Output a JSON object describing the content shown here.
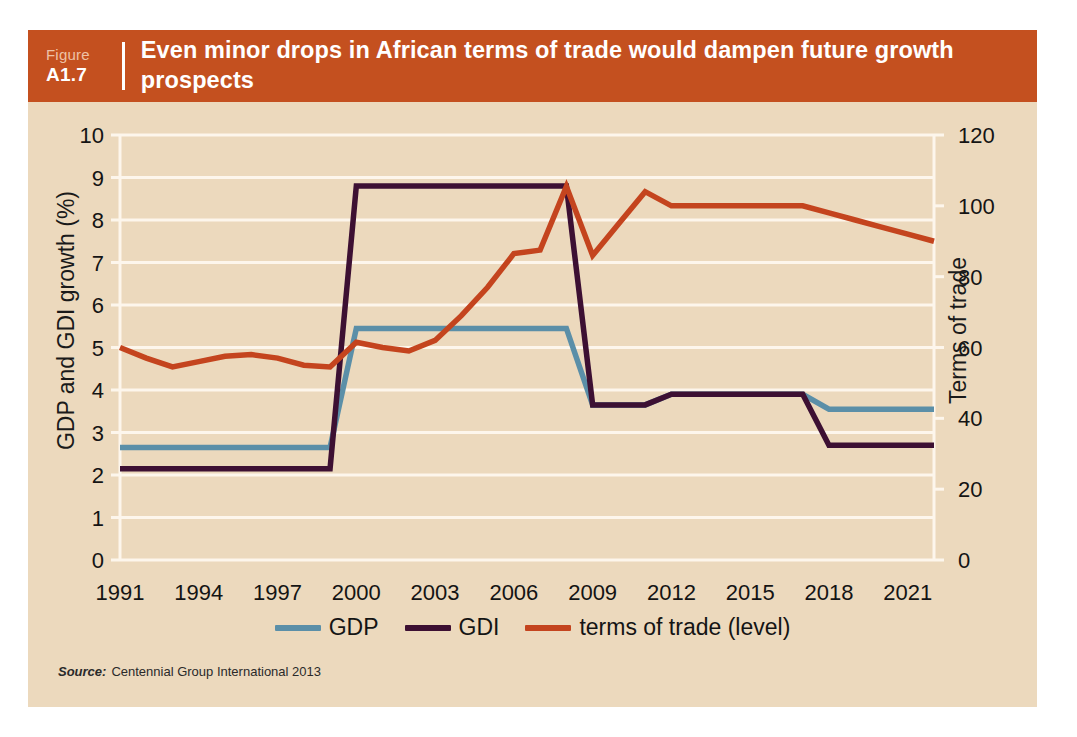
{
  "figure": {
    "label_word": "Figure",
    "number": "A1.7",
    "title": "Even minor drops in African terms of trade would dampen future growth prospects",
    "source_word": "Source:",
    "source_text": "Centennial Group International 2013"
  },
  "colors": {
    "header_bg": "#c4501f",
    "card_bg": "#ecd9bd",
    "gdp": "#5b8fa8",
    "gdi": "#3d1033",
    "terms_of_trade": "#c4441e",
    "gridline": "#fdf6ec",
    "text": "#141414"
  },
  "legend": {
    "position": "bottom-center",
    "items": [
      {
        "label": "GDP",
        "color": "#5b8fa8"
      },
      {
        "label": "GDI",
        "color": "#3d1033"
      },
      {
        "label": "terms of trade (level)",
        "color": "#c4441e"
      }
    ]
  },
  "chart_data": {
    "type": "line",
    "title": "Even minor drops in African terms of trade would dampen future growth prospects",
    "xlabel": "",
    "ylabel": "GDP and GDI growth (%)",
    "y2label": "Terms of trade",
    "grid": true,
    "xlim": [
      1991,
      2022
    ],
    "ylim": [
      0,
      10
    ],
    "y2lim": [
      0,
      120
    ],
    "yticks": [
      0,
      1,
      2,
      3,
      4,
      5,
      6,
      7,
      8,
      9,
      10
    ],
    "y2ticks": [
      0,
      20,
      40,
      60,
      80,
      100,
      120
    ],
    "xticks": [
      1991,
      1994,
      1997,
      2000,
      2003,
      2006,
      2009,
      2012,
      2015,
      2018,
      2021
    ],
    "x": [
      1991,
      1992,
      1993,
      1994,
      1995,
      1996,
      1997,
      1998,
      1999,
      2000,
      2001,
      2002,
      2003,
      2004,
      2005,
      2006,
      2007,
      2008,
      2009,
      2010,
      2011,
      2012,
      2013,
      2014,
      2015,
      2016,
      2017,
      2018,
      2019,
      2020,
      2021,
      2022
    ],
    "series": [
      {
        "name": "GDP",
        "axis": "left",
        "color": "#5b8fa8",
        "units": "percent growth",
        "values": [
          2.65,
          2.65,
          2.65,
          2.65,
          2.65,
          2.65,
          2.65,
          2.65,
          2.65,
          5.45,
          5.45,
          5.45,
          5.45,
          5.45,
          5.45,
          5.45,
          5.45,
          5.45,
          3.65,
          3.65,
          3.65,
          3.9,
          3.9,
          3.9,
          3.9,
          3.9,
          3.9,
          3.55,
          3.55,
          3.55,
          3.55,
          3.55
        ]
      },
      {
        "name": "GDI",
        "axis": "left",
        "color": "#3d1033",
        "units": "percent growth",
        "values": [
          2.15,
          2.15,
          2.15,
          2.15,
          2.15,
          2.15,
          2.15,
          2.15,
          2.15,
          8.8,
          8.8,
          8.8,
          8.8,
          8.8,
          8.8,
          8.8,
          8.8,
          8.8,
          3.65,
          3.65,
          3.65,
          3.9,
          3.9,
          3.9,
          3.9,
          3.9,
          3.9,
          2.7,
          2.7,
          2.7,
          2.7,
          2.7
        ]
      },
      {
        "name": "terms of trade (level)",
        "axis": "right",
        "color": "#c4441e",
        "units": "index level",
        "values": [
          60,
          57,
          54.5,
          56,
          57.5,
          58,
          57,
          55,
          54.5,
          61.5,
          60,
          59,
          62,
          69,
          77,
          86.5,
          87.5,
          105.5,
          86,
          95,
          104,
          100,
          100,
          100,
          100,
          100,
          100,
          98,
          96,
          94,
          92,
          90
        ]
      }
    ]
  }
}
